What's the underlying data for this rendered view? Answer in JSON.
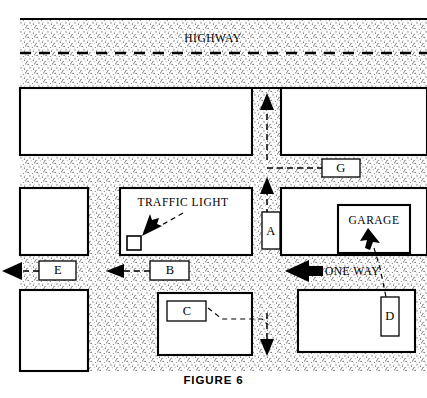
{
  "figure": {
    "caption": "FIGURE 6",
    "width": 427,
    "height": 398
  },
  "colors": {
    "ink": "#000000",
    "paper": "#ffffff",
    "pavement": "#d9d9d9"
  },
  "annotations": {
    "highway": "HIGHWAY",
    "traffic_light": "TRAFFIC LIGHT",
    "garage": "GARAGE",
    "one_way": "ONE WAY"
  },
  "markers": [
    {
      "id": "A",
      "label": "A",
      "orientation": "vertical",
      "x": 262,
      "y": 212,
      "w": 18,
      "h": 37
    },
    {
      "id": "B",
      "label": "B",
      "orientation": "horizontal",
      "x": 150,
      "y": 261,
      "w": 39,
      "h": 19
    },
    {
      "id": "C",
      "label": "C",
      "orientation": "horizontal",
      "x": 167,
      "y": 301,
      "w": 39,
      "h": 20
    },
    {
      "id": "D",
      "label": "D",
      "orientation": "vertical",
      "x": 381,
      "y": 297,
      "w": 18,
      "h": 39
    },
    {
      "id": "E",
      "label": "E",
      "orientation": "horizontal",
      "x": 39,
      "y": 261,
      "w": 37,
      "h": 19
    },
    {
      "id": "G",
      "label": "G",
      "orientation": "horizontal",
      "x": 322,
      "y": 159,
      "w": 38,
      "h": 18
    }
  ],
  "arrows": [
    {
      "name": "north-arrow-upper",
      "direction": "up",
      "tip_x": 267,
      "tip_y": 95
    },
    {
      "name": "north-arrow-lower",
      "direction": "up",
      "tip_x": 267,
      "tip_y": 179
    },
    {
      "name": "south-arrow-bottom",
      "direction": "down",
      "tip_x": 267,
      "tip_y": 354
    },
    {
      "name": "west-arrow-b",
      "direction": "left",
      "tip_x": 108,
      "tip_y": 271
    },
    {
      "name": "west-arrow-e",
      "direction": "left",
      "tip_x": 3,
      "tip_y": 271
    },
    {
      "name": "one-way-arrow",
      "direction": "left",
      "tip_x": 285,
      "tip_y": 271
    },
    {
      "name": "traffic-light-pointer",
      "direction": "down-left",
      "tip_x": 139,
      "tip_y": 232
    },
    {
      "name": "garage-pointer",
      "direction": "up-left",
      "tip_x": 370,
      "tip_y": 234
    }
  ],
  "roads": {
    "highway_horizontal": {
      "top": 19,
      "bottom": 88,
      "center_line_y": 53
    },
    "mid_horizontal": {
      "top": 155,
      "bottom": 188
    },
    "lower_horizontal": {
      "top": 255,
      "bottom": 290
    },
    "center_vertical": {
      "left": 252,
      "right": 281
    },
    "left_vertical": {
      "left": 88,
      "right": 120
    }
  }
}
